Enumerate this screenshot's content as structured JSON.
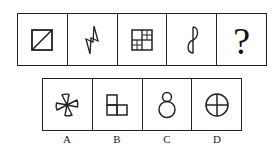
{
  "puzzle": {
    "question_row": {
      "cells": [
        {
          "figure": "square-with-diagonal",
          "description": "Square divided by a diagonal from bottom-left to top-right"
        },
        {
          "figure": "lightning-bolt",
          "description": "Zig-zag closed lightning bolt outline"
        },
        {
          "figure": "quadrant-grid",
          "description": "Square in 4 quadrants; top-right and bottom-left subdivided into 2x2"
        },
        {
          "figure": "figure-eight-half",
          "description": "Figure-8 style closed curve with straight vertical spine"
        },
        {
          "figure": "question-mark",
          "text": "?"
        }
      ]
    },
    "option_row": {
      "options": [
        {
          "label": "A",
          "figure": "pinwheel-fan",
          "description": "Four fan blades around a central point"
        },
        {
          "label": "B",
          "figure": "l-shape-three-squares",
          "description": "Three squares forming an L-shape"
        },
        {
          "label": "C",
          "figure": "two-circles-stacked",
          "description": "Small circle atop larger circle, touching"
        },
        {
          "label": "D",
          "figure": "circle-with-cross",
          "description": "Circle divided by a vertical and horizontal line"
        }
      ]
    },
    "colors": {
      "line": "#222222",
      "background": "#ffffff"
    }
  }
}
